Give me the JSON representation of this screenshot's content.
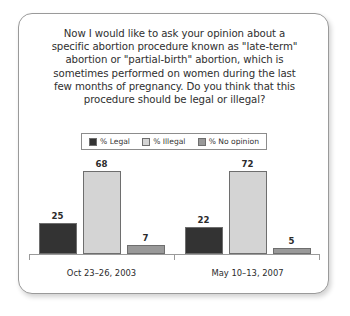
{
  "question": {
    "lines": [
      "Now I would like to ask your opinion about a",
      "specific abortion procedure known as \"late-term\"",
      "abortion or \"partial-birth\" abortion, which is",
      "sometimes performed on women during the last",
      "few months of pregnancy. Do you think that this",
      "procedure should be legal or illegal?"
    ]
  },
  "legend": {
    "items": [
      {
        "label": "% Legal",
        "color": "#333333"
      },
      {
        "label": "% Illegal",
        "color": "#d4d4d4"
      },
      {
        "label": "% No opinion",
        "color": "#999999"
      }
    ]
  },
  "chart_data": {
    "type": "bar",
    "xlabel": "",
    "ylabel": "",
    "ylim": [
      0,
      100
    ],
    "grid": false,
    "legend_position": "top-center",
    "categories": [
      "Oct 23–26, 2003",
      "May 10–13, 2007"
    ],
    "series": [
      {
        "name": "% Legal",
        "color": "#333333",
        "values": [
          25,
          22
        ]
      },
      {
        "name": "% Illegal",
        "color": "#d4d4d4",
        "values": [
          68,
          72
        ]
      },
      {
        "name": "% No opinion",
        "color": "#999999",
        "values": [
          7,
          5
        ]
      }
    ]
  }
}
